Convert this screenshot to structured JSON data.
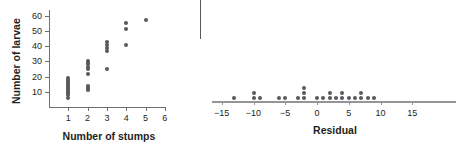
{
  "figure": {
    "background": "#ffffff",
    "dot_color": "#58595b",
    "axis_color": "#6d6e71"
  },
  "scatter": {
    "ylabel": "Number of larvae",
    "xlabel": "Number of stumps",
    "y_ticks": [
      "10",
      "20",
      "30",
      "40",
      "50",
      "60"
    ],
    "x_ticks": [
      "1",
      "2",
      "3",
      "4",
      "5",
      "6"
    ]
  },
  "residual": {
    "xlabel": "Residual",
    "x_ticks": [
      "−15",
      "−10",
      "−5",
      "0",
      "5",
      "10",
      "15"
    ]
  },
  "chart_data": [
    {
      "type": "scatter",
      "title": "",
      "xlabel": "Number of stumps",
      "ylabel": "Number of larvae",
      "xlim": [
        0,
        6.5
      ],
      "ylim": [
        0,
        65
      ],
      "xticks": [
        1,
        2,
        3,
        4,
        5,
        6
      ],
      "yticks": [
        10,
        20,
        30,
        40,
        50,
        60
      ],
      "grid": false,
      "legend": "none",
      "points": [
        {
          "x": 1,
          "y": 6
        },
        {
          "x": 1,
          "y": 8
        },
        {
          "x": 1,
          "y": 9
        },
        {
          "x": 1,
          "y": 10
        },
        {
          "x": 1,
          "y": 11
        },
        {
          "x": 1,
          "y": 12
        },
        {
          "x": 1,
          "y": 13
        },
        {
          "x": 1,
          "y": 14
        },
        {
          "x": 1,
          "y": 15
        },
        {
          "x": 1,
          "y": 16
        },
        {
          "x": 1,
          "y": 17
        },
        {
          "x": 1,
          "y": 18
        },
        {
          "x": 1,
          "y": 19
        },
        {
          "x": 2,
          "y": 11
        },
        {
          "x": 2,
          "y": 12
        },
        {
          "x": 2,
          "y": 13
        },
        {
          "x": 2,
          "y": 14
        },
        {
          "x": 2,
          "y": 22
        },
        {
          "x": 2,
          "y": 25
        },
        {
          "x": 2,
          "y": 26
        },
        {
          "x": 2,
          "y": 28
        },
        {
          "x": 2,
          "y": 29
        },
        {
          "x": 2,
          "y": 30
        },
        {
          "x": 3,
          "y": 25
        },
        {
          "x": 3,
          "y": 37
        },
        {
          "x": 3,
          "y": 39
        },
        {
          "x": 3,
          "y": 41
        },
        {
          "x": 3,
          "y": 43
        },
        {
          "x": 4,
          "y": 41
        },
        {
          "x": 4,
          "y": 51
        },
        {
          "x": 4,
          "y": 55
        },
        {
          "x": 5,
          "y": 57
        }
      ]
    },
    {
      "type": "scatter",
      "title": "",
      "xlabel": "Residual",
      "ylabel": "",
      "xlim": [
        -17,
        17
      ],
      "ylim": [
        0,
        6
      ],
      "xticks": [
        -15,
        -10,
        -5,
        0,
        5,
        10,
        15
      ],
      "grid": false,
      "legend": "none",
      "note": "dotplot: stack counts of residual values",
      "stacks": [
        {
          "value": -13,
          "count": 1
        },
        {
          "value": -10,
          "count": 2
        },
        {
          "value": -9,
          "count": 1
        },
        {
          "value": -6,
          "count": 1
        },
        {
          "value": -5,
          "count": 1
        },
        {
          "value": -3,
          "count": 1
        },
        {
          "value": -2,
          "count": 3
        },
        {
          "value": 0,
          "count": 1
        },
        {
          "value": 1,
          "count": 1
        },
        {
          "value": 2,
          "count": 2
        },
        {
          "value": 3,
          "count": 1
        },
        {
          "value": 4,
          "count": 2
        },
        {
          "value": 5,
          "count": 1
        },
        {
          "value": 6,
          "count": 1
        },
        {
          "value": 7,
          "count": 2
        },
        {
          "value": 8,
          "count": 1
        },
        {
          "value": 9,
          "count": 1
        }
      ]
    }
  ]
}
